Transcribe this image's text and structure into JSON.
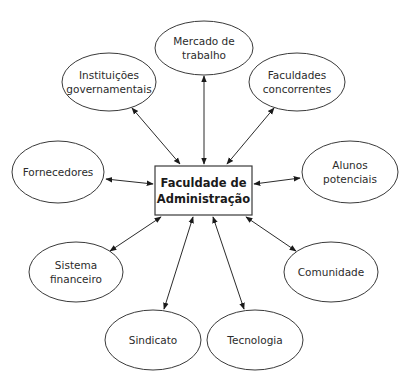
{
  "diagram": {
    "type": "stakeholder-map",
    "center": {
      "label_line1": "Faculdade de",
      "label_line2": "Administração"
    },
    "nodes": [
      {
        "id": "mercado",
        "line1": "Mercado de",
        "line2": "trabalho"
      },
      {
        "id": "instituicoes",
        "line1": "Instituições",
        "line2": "governamentais"
      },
      {
        "id": "faculdades",
        "line1": "Faculdades",
        "line2": "concorrentes"
      },
      {
        "id": "fornecedores",
        "line1": "Fornecedores",
        "line2": ""
      },
      {
        "id": "alunos",
        "line1": "Alunos",
        "line2": "potenciais"
      },
      {
        "id": "sistema",
        "line1": "Sistema",
        "line2": "financeiro"
      },
      {
        "id": "comunidade",
        "line1": "Comunidade",
        "line2": ""
      },
      {
        "id": "sindicato",
        "line1": "Sindicato",
        "line2": ""
      },
      {
        "id": "tecnologia",
        "line1": "Tecnologia",
        "line2": ""
      }
    ],
    "edges": "bidirectional arrows between center and every node",
    "colors": {
      "stroke": "#2b2b2b",
      "background": "#ffffff",
      "text": "#2b2b2b"
    }
  }
}
